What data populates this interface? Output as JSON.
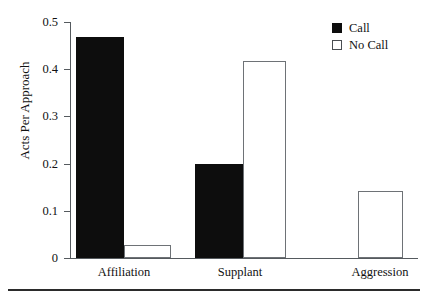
{
  "chart_data": {
    "type": "bar",
    "title": "",
    "xlabel": "",
    "ylabel": "Acts Per Approach",
    "categories": [
      "Affiliation",
      "Supplant",
      "Aggression"
    ],
    "series": [
      {
        "name": "Call",
        "values": [
          0.468,
          0.199,
          0.0
        ]
      },
      {
        "name": "No Call",
        "values": [
          0.028,
          0.417,
          0.142
        ]
      }
    ],
    "ylim": [
      0,
      0.5
    ],
    "ytick_labels": [
      "0",
      "0.1",
      "0.2",
      "0.3",
      "0.4",
      "0.5"
    ],
    "ytick_values": [
      0,
      0.1,
      0.2,
      0.3,
      0.4,
      0.5
    ],
    "grid": false,
    "legend_position": "top-right",
    "colors": {
      "call": "#0d0d0d",
      "no_call": "#ffffff",
      "outline": "#6e7276",
      "axis": "#555a5e",
      "text": "#111111",
      "background": "#ffffff"
    }
  },
  "legend": {
    "entries": [
      {
        "label": "Call",
        "swatch": "filled-square-icon"
      },
      {
        "label": "No Call",
        "swatch": "open-square-icon"
      }
    ]
  },
  "axes": {
    "y_title": "Acts Per Approach",
    "y_ticks": [
      "0.5",
      "0.4",
      "0.3",
      "0.2",
      "0.1",
      "0"
    ],
    "x_categories": [
      "Affiliation",
      "Supplant",
      "Aggression"
    ]
  }
}
